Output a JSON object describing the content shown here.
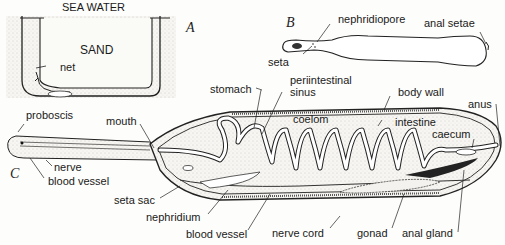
{
  "figure": {
    "panels": {
      "a": "A",
      "b": "B",
      "c": "C"
    },
    "panel_a": {
      "sea_water": "SEA WATER",
      "sand": "SAND",
      "net": "net"
    },
    "panel_b": {
      "nephridiopore": "nephridiopore",
      "anal_setae": "anal setae",
      "seta": "seta"
    },
    "panel_c": {
      "proboscis": "proboscis",
      "mouth": "mouth",
      "nerve": "nerve",
      "blood_vessel_left": "blood vessel",
      "stomach": "stomach",
      "periintestinal_sinus_1": "periintestinal",
      "periintestinal_sinus_2": "sinus",
      "body_wall": "body wall",
      "anus": "anus",
      "coelom": "coelom",
      "intestine": "intestine",
      "caecum": "caecum",
      "seta_sac": "seta sac",
      "nephridium": "nephridium",
      "blood_vessel_bottom": "blood vessel",
      "nerve_cord": "nerve cord",
      "gonad": "gonad",
      "anal_gland": "anal gland"
    }
  }
}
